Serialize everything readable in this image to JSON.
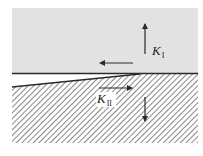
{
  "diagram": {
    "labels": {
      "mode_one": {
        "symbol": "K",
        "subscript": "I"
      },
      "mode_two": {
        "symbol": "K",
        "subscript": "II"
      }
    },
    "colors": {
      "upper_body": "#e2e2e2",
      "hatch": "#6a6a6a",
      "line": "#2a2a2a",
      "background": "#ffffff"
    },
    "regions": [
      "upper-solid-body",
      "lower-hatched-body",
      "crack-opening"
    ],
    "arrows": [
      {
        "name": "mode-one-up-arrow",
        "direction": "up"
      },
      {
        "name": "mode-one-down-arrow",
        "direction": "down"
      },
      {
        "name": "mode-two-left-arrow",
        "direction": "left"
      },
      {
        "name": "mode-two-right-arrow",
        "direction": "right"
      }
    ]
  }
}
